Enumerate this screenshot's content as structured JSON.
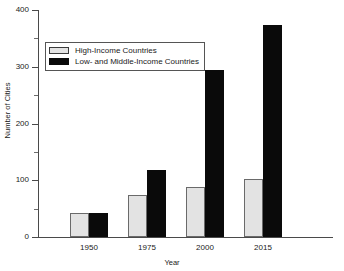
{
  "chart_data": {
    "type": "bar",
    "title": "",
    "subtitle": "",
    "xlabel": "Year",
    "ylabel": "Number of Cities",
    "categories": [
      "1950",
      "1975",
      "2000",
      "2015"
    ],
    "series": [
      {
        "name": "High-Income Countries",
        "color": "#e3e3e3",
        "values": [
          42,
          74,
          88,
          103
        ]
      },
      {
        "name": "Low- and Middle-Income Countries",
        "color": "#0a0a0a",
        "values": [
          42,
          118,
          295,
          373
        ]
      }
    ],
    "ylim": [
      0,
      400
    ],
    "yticks": [
      0,
      100,
      200,
      300,
      400
    ],
    "ytick_labels": [
      "0",
      "100",
      "200",
      "300",
      "400"
    ],
    "yminor_ticks": [
      50,
      150,
      250,
      350
    ],
    "grid": false,
    "legend_position": "upper-left"
  }
}
